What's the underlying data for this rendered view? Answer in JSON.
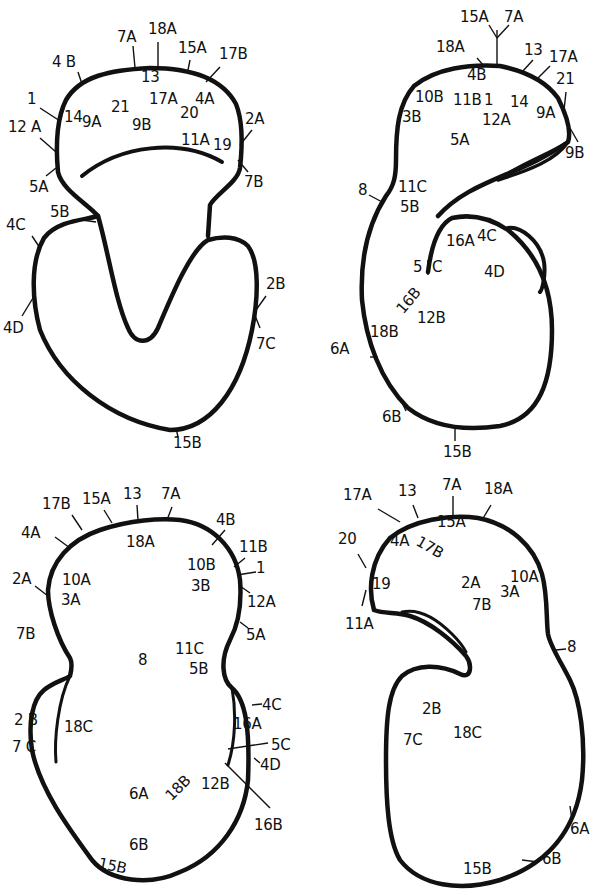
{
  "figure": {
    "colors": {
      "ink": "#111111",
      "background": "#ffffff"
    },
    "panels": [
      {
        "id": "top-left",
        "view": "front view",
        "labels": [
          {
            "text": "7A",
            "x": 117,
            "y": 30
          },
          {
            "text": "18A",
            "x": 148,
            "y": 22
          },
          {
            "text": "15A",
            "x": 178,
            "y": 41
          },
          {
            "text": "17B",
            "x": 219,
            "y": 47
          },
          {
            "text": "4 B",
            "x": 52,
            "y": 55
          },
          {
            "text": "13",
            "x": 141,
            "y": 70
          },
          {
            "text": "17A",
            "x": 149,
            "y": 92
          },
          {
            "text": "4A",
            "x": 195,
            "y": 92
          },
          {
            "text": "1",
            "x": 27,
            "y": 92
          },
          {
            "text": "14",
            "x": 64,
            "y": 110
          },
          {
            "text": "9A",
            "x": 82,
            "y": 115
          },
          {
            "text": "21",
            "x": 111,
            "y": 100
          },
          {
            "text": "20",
            "x": 180,
            "y": 106
          },
          {
            "text": "2A",
            "x": 245,
            "y": 112
          },
          {
            "text": "12 A",
            "x": 8,
            "y": 120
          },
          {
            "text": "9B",
            "x": 132,
            "y": 118
          },
          {
            "text": "11A",
            "x": 181,
            "y": 133
          },
          {
            "text": "19",
            "x": 213,
            "y": 138
          },
          {
            "text": "7B",
            "x": 244,
            "y": 175
          },
          {
            "text": "5A",
            "x": 29,
            "y": 180
          },
          {
            "text": "5B",
            "x": 50,
            "y": 205
          },
          {
            "text": "4C",
            "x": 6,
            "y": 218
          },
          {
            "text": "2B",
            "x": 266,
            "y": 277
          },
          {
            "text": "4D",
            "x": 3,
            "y": 321
          },
          {
            "text": "7C",
            "x": 256,
            "y": 337
          },
          {
            "text": "15B",
            "x": 173,
            "y": 436
          }
        ]
      },
      {
        "id": "top-right",
        "view": "left lateral view",
        "labels": [
          {
            "text": "15A",
            "x": 460,
            "y": 10
          },
          {
            "text": "7A",
            "x": 504,
            "y": 10
          },
          {
            "text": "18A",
            "x": 436,
            "y": 40
          },
          {
            "text": "13",
            "x": 524,
            "y": 43
          },
          {
            "text": "17A",
            "x": 549,
            "y": 50
          },
          {
            "text": "4B",
            "x": 467,
            "y": 68
          },
          {
            "text": "21",
            "x": 556,
            "y": 72
          },
          {
            "text": "10B",
            "x": 415,
            "y": 90
          },
          {
            "text": "11B",
            "x": 453,
            "y": 93
          },
          {
            "text": "1",
            "x": 484,
            "y": 93
          },
          {
            "text": "14",
            "x": 510,
            "y": 95
          },
          {
            "text": "9A",
            "x": 536,
            "y": 106
          },
          {
            "text": "3B",
            "x": 402,
            "y": 110
          },
          {
            "text": "12A",
            "x": 482,
            "y": 113
          },
          {
            "text": "5A",
            "x": 450,
            "y": 133
          },
          {
            "text": "9B",
            "x": 565,
            "y": 146
          },
          {
            "text": "8",
            "x": 358,
            "y": 183
          },
          {
            "text": "11C",
            "x": 398,
            "y": 180
          },
          {
            "text": "5B",
            "x": 400,
            "y": 200
          },
          {
            "text": "16A",
            "x": 446,
            "y": 234
          },
          {
            "text": "4C",
            "x": 477,
            "y": 229
          },
          {
            "text": "5",
            "x": 413,
            "y": 260
          },
          {
            "text": "C",
            "x": 432,
            "y": 260
          },
          {
            "text": "4D",
            "x": 484,
            "y": 265
          },
          {
            "text": "16B",
            "x": 394,
            "y": 307,
            "rotate": -50
          },
          {
            "text": "12B",
            "x": 417,
            "y": 311
          },
          {
            "text": "18B",
            "x": 370,
            "y": 325
          },
          {
            "text": "6A",
            "x": 330,
            "y": 342
          },
          {
            "text": "6B",
            "x": 382,
            "y": 410
          },
          {
            "text": "15B",
            "x": 443,
            "y": 445
          }
        ]
      },
      {
        "id": "bottom-left",
        "view": "posterior view",
        "labels": [
          {
            "text": "17B",
            "x": 42,
            "y": 497
          },
          {
            "text": "15A",
            "x": 82,
            "y": 492
          },
          {
            "text": "13",
            "x": 123,
            "y": 487
          },
          {
            "text": "7A",
            "x": 161,
            "y": 487
          },
          {
            "text": "4A",
            "x": 21,
            "y": 526
          },
          {
            "text": "18A",
            "x": 126,
            "y": 535
          },
          {
            "text": "4B",
            "x": 216,
            "y": 513
          },
          {
            "text": "11B",
            "x": 239,
            "y": 540
          },
          {
            "text": "10B",
            "x": 187,
            "y": 558
          },
          {
            "text": "1",
            "x": 256,
            "y": 561
          },
          {
            "text": "2A",
            "x": 12,
            "y": 572
          },
          {
            "text": "10A",
            "x": 62,
            "y": 573
          },
          {
            "text": "3B",
            "x": 191,
            "y": 579
          },
          {
            "text": "3A",
            "x": 61,
            "y": 593
          },
          {
            "text": "12A",
            "x": 247,
            "y": 595
          },
          {
            "text": "7B",
            "x": 16,
            "y": 627
          },
          {
            "text": "5A",
            "x": 246,
            "y": 628
          },
          {
            "text": "11C",
            "x": 175,
            "y": 642
          },
          {
            "text": "8",
            "x": 138,
            "y": 653
          },
          {
            "text": "5B",
            "x": 189,
            "y": 662
          },
          {
            "text": "4C",
            "x": 262,
            "y": 698
          },
          {
            "text": "2 B",
            "x": 14,
            "y": 713
          },
          {
            "text": "18C",
            "x": 64,
            "y": 720
          },
          {
            "text": "16A",
            "x": 233,
            "y": 717
          },
          {
            "text": "5C",
            "x": 271,
            "y": 738
          },
          {
            "text": "7 C",
            "x": 12,
            "y": 740
          },
          {
            "text": "4D",
            "x": 260,
            "y": 758
          },
          {
            "text": "6A",
            "x": 129,
            "y": 787
          },
          {
            "text": "18B",
            "x": 163,
            "y": 793,
            "rotate": -45
          },
          {
            "text": "12B",
            "x": 201,
            "y": 777
          },
          {
            "text": "16B",
            "x": 254,
            "y": 818
          },
          {
            "text": "6B",
            "x": 129,
            "y": 838
          },
          {
            "text": "15B",
            "x": 100,
            "y": 856,
            "rotate": 12
          }
        ]
      },
      {
        "id": "bottom-right",
        "view": "right lateral view",
        "labels": [
          {
            "text": "17A",
            "x": 343,
            "y": 488
          },
          {
            "text": "13",
            "x": 398,
            "y": 484
          },
          {
            "text": "7A",
            "x": 442,
            "y": 478
          },
          {
            "text": "18A",
            "x": 484,
            "y": 482
          },
          {
            "text": "15A",
            "x": 437,
            "y": 515
          },
          {
            "text": "20",
            "x": 338,
            "y": 532
          },
          {
            "text": "4A",
            "x": 390,
            "y": 534
          },
          {
            "text": "17B",
            "x": 421,
            "y": 539,
            "rotate": 30
          },
          {
            "text": "10A",
            "x": 510,
            "y": 570
          },
          {
            "text": "2A",
            "x": 461,
            "y": 576
          },
          {
            "text": "19",
            "x": 372,
            "y": 577
          },
          {
            "text": "3A",
            "x": 500,
            "y": 585
          },
          {
            "text": "7B",
            "x": 472,
            "y": 598
          },
          {
            "text": "11A",
            "x": 345,
            "y": 617
          },
          {
            "text": "8",
            "x": 567,
            "y": 640
          },
          {
            "text": "2B",
            "x": 422,
            "y": 702
          },
          {
            "text": "18C",
            "x": 453,
            "y": 726
          },
          {
            "text": "7C",
            "x": 403,
            "y": 733
          },
          {
            "text": "6A",
            "x": 570,
            "y": 822
          },
          {
            "text": "6B",
            "x": 542,
            "y": 852
          },
          {
            "text": "15B",
            "x": 463,
            "y": 862
          }
        ]
      }
    ]
  }
}
